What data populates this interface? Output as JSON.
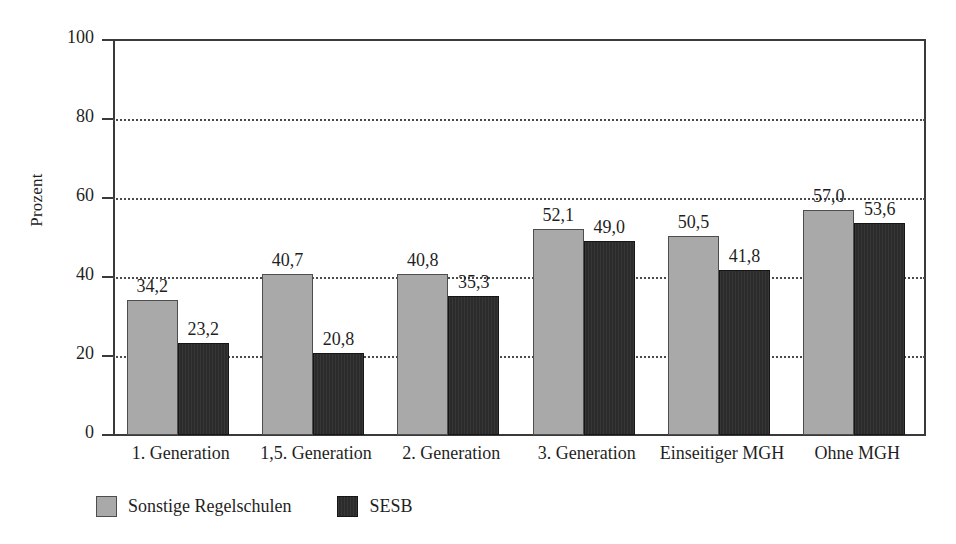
{
  "chart_data": {
    "type": "bar",
    "title": "",
    "xlabel": "",
    "ylabel": "Prozent",
    "ylim": [
      0,
      100
    ],
    "yticks": [
      0,
      20,
      40,
      60,
      80,
      100
    ],
    "ytick_labels": [
      "0",
      "20",
      "40",
      "60",
      "80",
      "100"
    ],
    "grid": "horizontal-dotted",
    "legend_position": "bottom-left",
    "categories": [
      "1. Generation",
      "1,5. Generation",
      "2. Generation",
      "3. Generation",
      "Einseitiger MGH",
      "Ohne MGH"
    ],
    "series": [
      {
        "name": "Sonstige Regelschulen",
        "color": "#a9a9a9",
        "values": [
          34.2,
          40.7,
          40.8,
          52.1,
          50.5,
          57.0
        ],
        "labels": [
          "34,2",
          "40,7",
          "40,8",
          "52,1",
          "50,5",
          "57,0"
        ]
      },
      {
        "name": "SESB",
        "color": "#2b2b2b",
        "values": [
          23.2,
          20.8,
          35.3,
          49.0,
          41.8,
          53.6
        ],
        "labels": [
          "23,2",
          "20,8",
          "35,3",
          "49,0",
          "41,8",
          "53,6"
        ]
      }
    ]
  },
  "colors": {
    "series_0": "#a9a9a9",
    "series_1": "#2b2b2b",
    "axis": "#3a3a3a",
    "grid": "#4a4a4a",
    "text": "#1f1f1f",
    "background": "#ffffff"
  }
}
